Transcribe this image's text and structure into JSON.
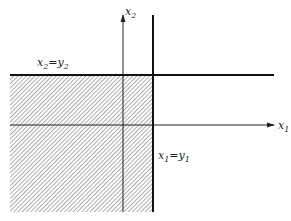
{
  "diagram": {
    "axes": {
      "x_axis_label": "x",
      "x_axis_sub": "1",
      "y_axis_label": "x",
      "y_axis_sub": "2"
    },
    "lines": {
      "horizontal": {
        "lhs": "x",
        "lhs_sub": "2",
        "eq": "=",
        "rhs": "y",
        "rhs_sub": "2"
      },
      "vertical": {
        "lhs": "x",
        "lhs_sub": "1",
        "eq": "=",
        "rhs": "y",
        "rhs_sub": "1"
      }
    },
    "region": {
      "description": "hatched quadrant x1 <= y1, x2 <= y2"
    },
    "colors": {
      "ink": "#222222",
      "hatch": "#555555",
      "background": "#ffffff"
    }
  }
}
